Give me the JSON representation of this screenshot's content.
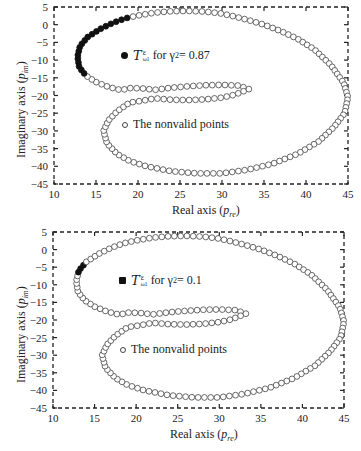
{
  "chart_data": [
    {
      "type": "scatter",
      "title": "",
      "xlabel": "Real axis (p_re)",
      "ylabel": "Imaginary axis (p_im)",
      "xlim": [
        10,
        45
      ],
      "ylim": [
        -45,
        5
      ],
      "xticks": [
        10,
        15,
        20,
        25,
        30,
        35,
        40,
        45
      ],
      "yticks": [
        5,
        0,
        -5,
        -10,
        -15,
        -20,
        -25,
        -30,
        -35,
        -40,
        -45
      ],
      "grid": false,
      "legend": [
        {
          "marker": "filled-circle",
          "label": "T^ε_ω1 for γ2 = 0.87"
        },
        {
          "marker": "open-circle",
          "label": "The nonvalid points"
        }
      ],
      "series": [
        {
          "name": "T^ε_ω1 for γ2 = 0.87",
          "marker": "filled",
          "arc": "left side from (13.5,-14) through (12.8,-8) to (18.3,1.8)"
        },
        {
          "name": "The nonvalid points",
          "marker": "open",
          "arc": "remainder of closed loop curve"
        }
      ],
      "filled_range": {
        "y_from": -14,
        "y_to": 2
      }
    },
    {
      "type": "scatter",
      "title": "",
      "xlabel": "Real axis (p_re)",
      "ylabel": "Imaginary axis (p_im)",
      "xlim": [
        10,
        45
      ],
      "ylim": [
        -45,
        5
      ],
      "xticks": [
        10,
        15,
        20,
        25,
        30,
        35,
        40,
        45
      ],
      "yticks": [
        5,
        0,
        -5,
        -10,
        -15,
        -20,
        -25,
        -30,
        -35,
        -40,
        -45
      ],
      "grid": false,
      "legend": [
        {
          "marker": "filled-circle",
          "label": "T^ε_ω1 for γ2 = 0.1"
        },
        {
          "marker": "open-circle",
          "label": "The nonvalid points"
        }
      ],
      "series": [
        {
          "name": "T^ε_ω1 for γ2 = 0.1",
          "marker": "filled",
          "arc": "small segment near (13.6,-5)"
        },
        {
          "name": "The nonvalid points",
          "marker": "open",
          "arc": "remainder of closed loop curve"
        }
      ],
      "filled_range": {
        "y_from": -6.5,
        "y_to": -3.5
      }
    }
  ],
  "curve_shape": [
    [
      33.2,
      -18.2
    ],
    [
      32,
      -17.2
    ],
    [
      30,
      -17
    ],
    [
      28,
      -17.1
    ],
    [
      26,
      -17.4
    ],
    [
      24,
      -17.8
    ],
    [
      22,
      -18.4
    ],
    [
      20.5,
      -18
    ],
    [
      19,
      -17.9
    ],
    [
      18,
      -18.5
    ],
    [
      16.5,
      -17.6
    ],
    [
      15,
      -16.2
    ],
    [
      13.8,
      -14.4
    ],
    [
      13,
      -12
    ],
    [
      12.8,
      -9
    ],
    [
      13.1,
      -6
    ],
    [
      14,
      -3.5
    ],
    [
      15.5,
      -1.2
    ],
    [
      17,
      0.5
    ],
    [
      18.5,
      1.8
    ],
    [
      20,
      2.6
    ],
    [
      22,
      3.4
    ],
    [
      24,
      3.8
    ],
    [
      26,
      3.9
    ],
    [
      28,
      3.7
    ],
    [
      29.8,
      3.2
    ],
    [
      31,
      2.6
    ],
    [
      33,
      1.4
    ],
    [
      35,
      0
    ],
    [
      37,
      -1.8
    ],
    [
      39,
      -4
    ],
    [
      41,
      -7
    ],
    [
      43,
      -11.5
    ],
    [
      44.5,
      -16.5
    ],
    [
      45,
      -20.5
    ],
    [
      44.6,
      -25
    ],
    [
      43.3,
      -29
    ],
    [
      41.5,
      -33
    ],
    [
      39,
      -36.5
    ],
    [
      36,
      -39.3
    ],
    [
      33,
      -41
    ],
    [
      30,
      -42
    ],
    [
      27,
      -42
    ],
    [
      24,
      -41.4
    ],
    [
      21,
      -40
    ],
    [
      19,
      -38.5
    ],
    [
      17.5,
      -36.5
    ],
    [
      16.3,
      -33.5
    ],
    [
      15.9,
      -30
    ],
    [
      16.5,
      -27
    ],
    [
      17.5,
      -24.5
    ],
    [
      19,
      -22
    ],
    [
      20.5,
      -21.5
    ],
    [
      22,
      -20.8
    ],
    [
      24,
      -21.2
    ],
    [
      26,
      -21.3
    ],
    [
      28,
      -21.1
    ],
    [
      30,
      -20.6
    ],
    [
      31.5,
      -19.8
    ],
    [
      33.2,
      -18.2
    ]
  ],
  "charts": [
    {
      "legend_filled": {
        "T": "T",
        "sup": "ε",
        "sub": "ω1",
        "text": "for γ",
        "subnum": "2",
        "eq": " = 0.87"
      },
      "legend_open": "The nonvalid points",
      "xlabel_main": "Real axis (",
      "xlabel_var": "p",
      "xlabel_sub": "re",
      "xlabel_close": ")",
      "ylabel_main": "Imaginary axis (",
      "ylabel_var": "p",
      "ylabel_sub": "im",
      "ylabel_close": ")"
    },
    {
      "legend_filled": {
        "T": "T",
        "sup": "ε",
        "sub": "ω1",
        "text": "for γ",
        "subnum": "2",
        "eq": " = 0.1"
      },
      "legend_open": "The nonvalid points",
      "xlabel_main": "Real axis (",
      "xlabel_var": "p",
      "xlabel_sub": "re",
      "xlabel_close": ")",
      "ylabel_main": "Imaginary axis (",
      "ylabel_var": "p",
      "ylabel_sub": "im",
      "ylabel_close": ")"
    }
  ],
  "colors": {
    "axis": "#222222",
    "marker_edge": "#444444",
    "marker_fill": "#111111"
  }
}
